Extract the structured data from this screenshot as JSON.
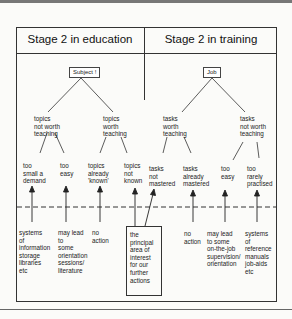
{
  "headers": {
    "education": "Stage 2 in education",
    "training": "Stage 2 in training"
  },
  "education": {
    "root": "Subject !",
    "branches": [
      {
        "label": "topics\nnot worth\nteaching"
      },
      {
        "label": "topics\nworth\nteaching"
      }
    ],
    "leaves": [
      {
        "label": "too\nsmall a\ndemand",
        "action": "systems\nof\ninformation\nstorage\nlibraries\netc"
      },
      {
        "label": "too\neasy",
        "action": "may lead\nto\nsome\norientation\nsessions/\nliterature"
      },
      {
        "label": "topics\nalready\n'known'",
        "action": "no\naction"
      },
      {
        "label": "topics\nnot\nknown",
        "action": ""
      }
    ]
  },
  "training": {
    "root": "Job",
    "branches": [
      {
        "label": "tasks\nworth\nteaching"
      },
      {
        "label": "tasks\nnot worth\nteaching"
      }
    ],
    "leaves": [
      {
        "label": "tasks\nnot\nmastered",
        "action": ""
      },
      {
        "label": "tasks\nalready\nmastered",
        "action": "no\naction"
      },
      {
        "label": "too\neasy",
        "action": "may lead\nto some\non-the-job\nsupervision/\norientation"
      },
      {
        "label": "too\nrarely\npractised",
        "action": "systems\nof\nreference\nmanuals\njob-aids\netc"
      }
    ]
  },
  "focus_box": {
    "label": "the\nprincipal\narea of\ninterest\nfor our\nfurther\nactions"
  },
  "colors": {
    "line": "#333333",
    "background": "#fbfbf9"
  }
}
